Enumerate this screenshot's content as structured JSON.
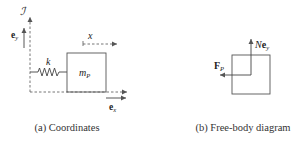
{
  "figure": {
    "panel_a": {
      "caption": "(a) Coordinates",
      "frame_label": "ℐ",
      "ey_label": "e",
      "ey_sub": "y",
      "ex_label": "e",
      "ex_sub": "x",
      "spring_label": "k",
      "mass_label": "m",
      "mass_sub": "P",
      "coord_label": "x"
    },
    "panel_b": {
      "caption": "(b) Free-body diagram",
      "force_label": "F",
      "force_sub": "P",
      "normal_label_N": "N",
      "normal_label_e": "e",
      "normal_sub": "y"
    },
    "colors": {
      "stroke": "#555555",
      "text": "#222222"
    }
  }
}
